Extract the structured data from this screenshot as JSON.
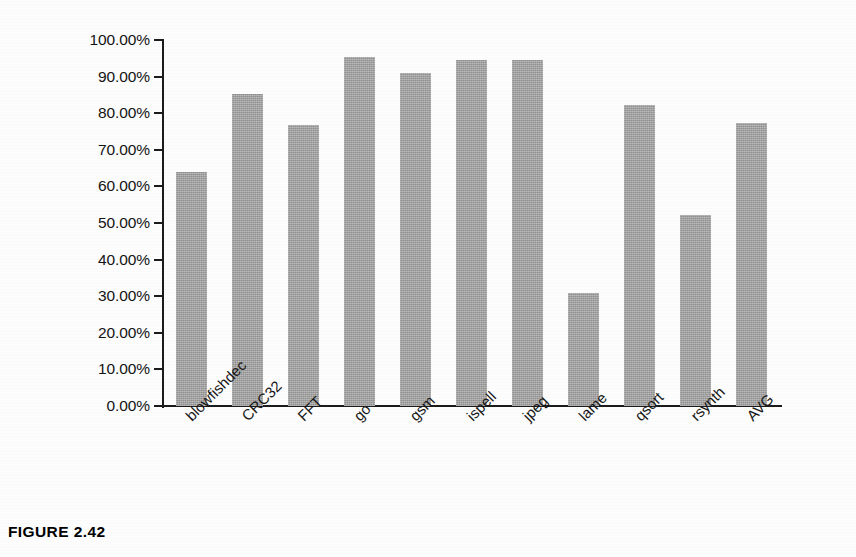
{
  "figure": {
    "caption": "FIGURE 2.42"
  },
  "chart_data": {
    "type": "bar",
    "title": "",
    "subtitle": "",
    "xlabel": "",
    "ylabel": "",
    "categories": [
      "blowfishdec",
      "CRC32",
      "FFT",
      "go",
      "gsm",
      "ispell",
      "jpeg",
      "lame",
      "qsort",
      "rsynth",
      "AVG"
    ],
    "values": [
      64.0,
      85.3,
      76.7,
      95.4,
      91.0,
      94.5,
      94.5,
      31.0,
      82.2,
      52.2,
      77.2
    ],
    "series": [
      {
        "name": "",
        "values": [
          64.0,
          85.3,
          76.7,
          95.4,
          91.0,
          94.5,
          94.5,
          31.0,
          82.2,
          52.2,
          77.2
        ]
      }
    ],
    "ylim": [
      0,
      100
    ],
    "ytick_values": [
      0,
      10,
      20,
      30,
      40,
      50,
      60,
      70,
      80,
      90,
      100
    ],
    "ytick_labels": [
      "0.00%",
      "10.00%",
      "20.00%",
      "30.00%",
      "40.00%",
      "50.00%",
      "60.00%",
      "70.00%",
      "80.00%",
      "90.00%",
      "100.00%"
    ],
    "grid": false,
    "legend": false,
    "legend_position": "none",
    "bar_color": "#9d9d9d",
    "axis_color": "#1b1b1b",
    "value_format": "percent",
    "xtick_rotation": -45
  }
}
